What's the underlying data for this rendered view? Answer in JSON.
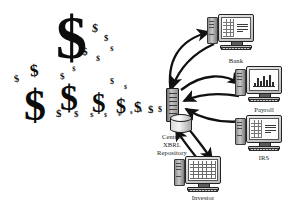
{
  "diagram": {
    "background": "#ffffff",
    "ink": "#111111"
  },
  "money_stream": {
    "symbol": "$",
    "description": "cascade of dollar signs flowing from upper-left to the repository",
    "glyphs": [
      {
        "x": 56,
        "y": 6,
        "size": 62,
        "rot": 0
      },
      {
        "x": 30,
        "y": 62,
        "size": 17,
        "rot": -6
      },
      {
        "x": 14,
        "y": 74,
        "size": 10,
        "rot": -8
      },
      {
        "x": 92,
        "y": 22,
        "size": 12,
        "rot": 5
      },
      {
        "x": 104,
        "y": 34,
        "size": 9,
        "rot": 4
      },
      {
        "x": 82,
        "y": 46,
        "size": 11,
        "rot": -3
      },
      {
        "x": 96,
        "y": 55,
        "size": 8,
        "rot": 6
      },
      {
        "x": 110,
        "y": 46,
        "size": 7,
        "rot": 2
      },
      {
        "x": 60,
        "y": 72,
        "size": 9,
        "rot": -4
      },
      {
        "x": 72,
        "y": 66,
        "size": 7,
        "rot": 3
      },
      {
        "x": 24,
        "y": 84,
        "size": 44,
        "rot": 0
      },
      {
        "x": 60,
        "y": 80,
        "size": 36,
        "rot": 0
      },
      {
        "x": 92,
        "y": 90,
        "size": 27,
        "rot": 0
      },
      {
        "x": 116,
        "y": 96,
        "size": 20,
        "rot": 0
      },
      {
        "x": 134,
        "y": 100,
        "size": 15,
        "rot": 0
      },
      {
        "x": 148,
        "y": 104,
        "size": 11,
        "rot": 0
      },
      {
        "x": 158,
        "y": 106,
        "size": 8,
        "rot": 0
      },
      {
        "x": 166,
        "y": 108,
        "size": 6,
        "rot": 0
      },
      {
        "x": 56,
        "y": 108,
        "size": 11,
        "rot": 0
      },
      {
        "x": 74,
        "y": 110,
        "size": 9,
        "rot": 0
      },
      {
        "x": 90,
        "y": 112,
        "size": 7,
        "rot": 0
      },
      {
        "x": 104,
        "y": 112,
        "size": 6,
        "rot": 0
      },
      {
        "x": 118,
        "y": 112,
        "size": 5,
        "rot": 0
      },
      {
        "x": 130,
        "y": 110,
        "size": 5,
        "rot": 0
      },
      {
        "x": 140,
        "y": 109,
        "size": 4,
        "rot": 0
      },
      {
        "x": 110,
        "y": 78,
        "size": 8,
        "rot": 0
      },
      {
        "x": 124,
        "y": 84,
        "size": 6,
        "rot": 0
      }
    ]
  },
  "repository": {
    "name": "central-xbrl-repository",
    "label_lines": [
      "Central",
      "XBRL",
      "Repository"
    ],
    "label": "Central XBRL Repository"
  },
  "nodes": [
    {
      "id": "bank",
      "label": "Bank",
      "screen": "table-and-text",
      "x": 218,
      "y": 14,
      "label_x": 216,
      "label_y": 57
    },
    {
      "id": "payroll",
      "label": "Payroll",
      "screen": "bar-chart",
      "x": 246,
      "y": 66,
      "label_x": 244,
      "label_y": 106
    },
    {
      "id": "irs",
      "label": "IRS",
      "screen": "table-and-text",
      "x": 246,
      "y": 115,
      "label_x": 244,
      "label_y": 154
    },
    {
      "id": "investor",
      "label": "Investor",
      "screen": "spreadsheet",
      "x": 185,
      "y": 156,
      "label_x": 183,
      "label_y": 194
    }
  ],
  "arrows": [
    {
      "from": "repository",
      "to": "bank",
      "direction": "to-node"
    },
    {
      "from": "bank",
      "to": "repository",
      "direction": "to-repository"
    },
    {
      "from": "repository",
      "to": "payroll",
      "direction": "to-node"
    },
    {
      "from": "payroll",
      "to": "repository",
      "direction": "to-repository"
    },
    {
      "from": "irs",
      "to": "repository",
      "direction": "to-repository"
    },
    {
      "from": "repository",
      "to": "investor",
      "direction": "to-node"
    },
    {
      "from": "investor",
      "to": "repository",
      "direction": "to-repository"
    }
  ]
}
